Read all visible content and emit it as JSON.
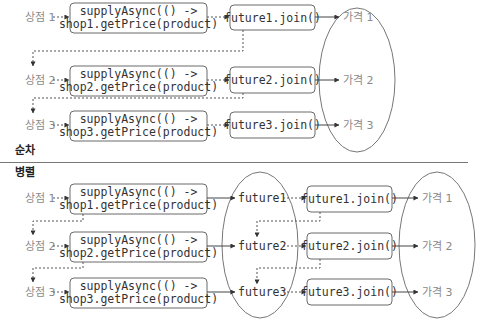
{
  "sections": {
    "sequential": {
      "title": "순차",
      "rows": [
        {
          "shop": "상점 1",
          "task_line1": "supplyAsync(() ->",
          "task_line2": "shop1.getPrice(product)",
          "join": "future1.join()",
          "price": "가격 1"
        },
        {
          "shop": "상점 2",
          "task_line1": "supplyAsync(() ->",
          "task_line2": "shop2.getPrice(product)",
          "join": "future2.join()",
          "price": "가격 2"
        },
        {
          "shop": "상점 3",
          "task_line1": "supplyAsync(() ->",
          "task_line2": "shop3.getPrice(product)",
          "join": "future3.join()",
          "price": "가격 3"
        }
      ]
    },
    "parallel": {
      "title": "병렬",
      "rows": [
        {
          "shop": "상점 1",
          "task_line1": "supplyAsync(() ->",
          "task_line2": "shop1.getPrice(product)",
          "future": "future1",
          "join": "future1.join()",
          "price": "가격 1"
        },
        {
          "shop": "상점 2",
          "task_line1": "supplyAsync(() ->",
          "task_line2": "shop2.getPrice(product)",
          "future": "future2",
          "join": "future2.join()",
          "price": "가격 2"
        },
        {
          "shop": "상점 3",
          "task_line1": "supplyAsync(() ->",
          "task_line2": "shop3.getPrice(product)",
          "future": "future3",
          "join": "future3.join()",
          "price": "가격 3"
        }
      ]
    }
  },
  "colors": {
    "box_stroke": "#6a6a6a",
    "text": "#333333",
    "label": "#8a8a8a",
    "separator": "#777777"
  }
}
